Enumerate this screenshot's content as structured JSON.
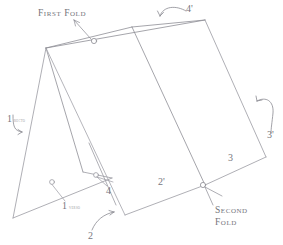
{
  "diagram": {
    "colors": {
      "background": "#ffffff",
      "line": "#9a9aa2",
      "line_dark": "#86868e",
      "text": "#76767d",
      "text_light": "#9a9aa1",
      "marker_stroke": "#9a9aa2"
    },
    "fold_labels": [
      {
        "id": "first-fold",
        "text": "First Fold",
        "lines": [
          "First Fold"
        ]
      },
      {
        "id": "second-fold",
        "text": "Second Fold",
        "lines": [
          "Second",
          "Fold"
        ]
      }
    ],
    "panel_labels": [
      {
        "id": "panel-1-recto",
        "number": "1",
        "note": "recto"
      },
      {
        "id": "panel-1-verso",
        "number": "1",
        "note": "verso"
      },
      {
        "id": "panel-2",
        "number": "2",
        "note": ""
      },
      {
        "id": "panel-2-prime",
        "number": "2'",
        "note": ""
      },
      {
        "id": "panel-3",
        "number": "3",
        "note": ""
      },
      {
        "id": "panel-3-prime",
        "number": "3'",
        "note": ""
      },
      {
        "id": "panel-4",
        "number": "4",
        "note": ""
      },
      {
        "id": "panel-4-prime",
        "number": "4'",
        "note": ""
      }
    ],
    "labels": {
      "first_fold": "First Fold",
      "second_fold_line1": "Second",
      "second_fold_line2": "Fold",
      "n1_a": "1",
      "n1_a_note": "recto",
      "n1_b": "1",
      "n1_b_note": "verso",
      "n2": "2",
      "n2_prime": "2'",
      "n3": "3",
      "n3_prime": "3'",
      "n4": "4",
      "n4_prime": "4'"
    }
  }
}
